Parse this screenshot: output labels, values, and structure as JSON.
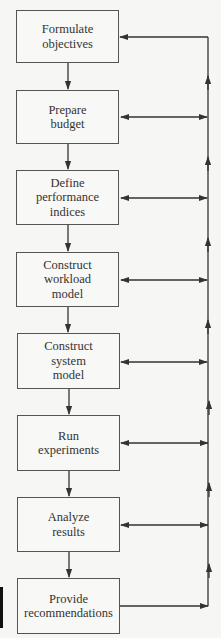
{
  "diagram": {
    "type": "flowchart",
    "direction": "top-to-bottom",
    "feedback_line": "right-side vertical bus with upward arrows returning to earlier steps",
    "colors": {
      "background": "#f6f6f4",
      "line": "#333333",
      "box_border": "#555555",
      "text": "#333333"
    },
    "steps": [
      {
        "id": "s1",
        "label": "Formulate\nobjectives",
        "top": 10,
        "height": 53,
        "feedback": "in"
      },
      {
        "id": "s2",
        "label": "Prepare\nbudget",
        "top": 90,
        "height": 54,
        "feedback": "both"
      },
      {
        "id": "s3",
        "label": "Define\nperformance\nindices",
        "top": 170,
        "height": 55,
        "feedback": "both"
      },
      {
        "id": "s4",
        "label": "Construct\nworkload\nmodel",
        "top": 252,
        "height": 55,
        "feedback": "both"
      },
      {
        "id": "s5",
        "label": "Construct\nsystem\nmodel",
        "top": 333,
        "height": 56,
        "feedback": "both"
      },
      {
        "id": "s6",
        "label": "Run\nexperiments",
        "top": 415,
        "height": 56,
        "feedback": "both"
      },
      {
        "id": "s7",
        "label": "Analyze\nresults",
        "top": 497,
        "height": 55,
        "feedback": "both"
      },
      {
        "id": "s8",
        "label": "Provide\nrecommendations",
        "top": 578,
        "height": 56,
        "feedback": "out"
      }
    ]
  }
}
